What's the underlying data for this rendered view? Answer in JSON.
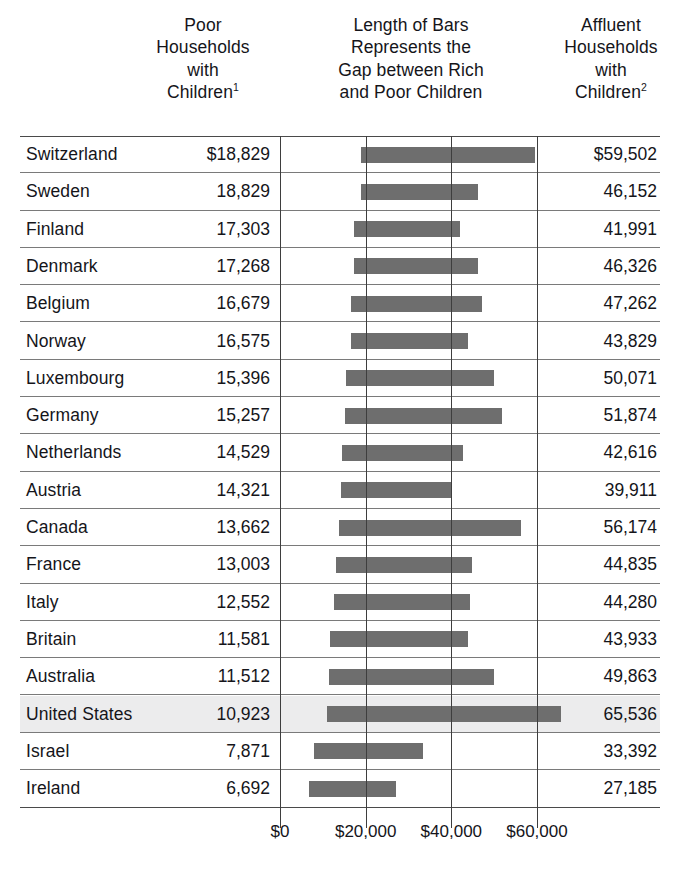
{
  "headers": {
    "poor": "Poor\nHouseholds\nwith\nChildren",
    "poor_lines": [
      "Poor",
      "Households",
      "with",
      "Children"
    ],
    "poor_superscript": "1",
    "middle_lines": [
      "Length of Bars",
      "Represents the",
      "Gap between Rich",
      "and Poor Children"
    ],
    "affluent_lines": [
      "Affluent",
      "Households",
      "with",
      "Children"
    ],
    "affluent_superscript": "2"
  },
  "colors": {
    "bar": "#6e6e6e",
    "highlight_row": "#ececed",
    "gridline": "#3e3e3e",
    "row_rule": "#7a7a7a",
    "frame_rule": "#4a4a4a",
    "text": "#15151a"
  },
  "axis": {
    "ticks": [
      "$0",
      "$20,000",
      "$40,000",
      "$60,000"
    ],
    "tick_values": [
      0,
      20000,
      40000,
      60000
    ],
    "x_zero_px": 280,
    "px_per_dollar": 0.004283
  },
  "chart_data": {
    "type": "bar",
    "title": "Length of Bars Represents the Gap between Rich and Poor Children",
    "xlabel": "",
    "ylabel": "",
    "xlim": [
      0,
      70000
    ],
    "grid": true,
    "legend": "none",
    "orientation": "horizontal",
    "bar_style": "floating-range",
    "note": "Each bar spans from the Poor Households value to the Affluent Households value.",
    "columns": [
      "Country",
      "Poor Households with Children",
      "Affluent Households with Children"
    ],
    "categories": [
      "Switzerland",
      "Sweden",
      "Finland",
      "Denmark",
      "Belgium",
      "Norway",
      "Luxembourg",
      "Germany",
      "Netherlands",
      "Austria",
      "Canada",
      "France",
      "Italy",
      "Britain",
      "Australia",
      "United States",
      "Israel",
      "Ireland"
    ],
    "series": [
      {
        "name": "Poor Households with Children",
        "values": [
          18829,
          18829,
          17303,
          17268,
          16679,
          16575,
          15396,
          15257,
          14529,
          14321,
          13662,
          13003,
          12552,
          11581,
          11512,
          10923,
          7871,
          6692
        ]
      },
      {
        "name": "Affluent Households with Children",
        "values": [
          59502,
          46152,
          41991,
          46326,
          47262,
          43829,
          50071,
          51874,
          42616,
          39911,
          56174,
          44835,
          44280,
          43933,
          49863,
          65536,
          33392,
          27185
        ]
      }
    ]
  },
  "rows": [
    {
      "country": "Switzerland",
      "poor": "$18,829",
      "affluent": "$59,502",
      "poor_value": 18829,
      "affluent_value": 59502,
      "highlight": false
    },
    {
      "country": "Sweden",
      "poor": "18,829",
      "affluent": "46,152",
      "poor_value": 18829,
      "affluent_value": 46152,
      "highlight": false
    },
    {
      "country": "Finland",
      "poor": "17,303",
      "affluent": "41,991",
      "poor_value": 17303,
      "affluent_value": 41991,
      "highlight": false
    },
    {
      "country": "Denmark",
      "poor": "17,268",
      "affluent": "46,326",
      "poor_value": 17268,
      "affluent_value": 46326,
      "highlight": false
    },
    {
      "country": "Belgium",
      "poor": "16,679",
      "affluent": "47,262",
      "poor_value": 16679,
      "affluent_value": 47262,
      "highlight": false
    },
    {
      "country": "Norway",
      "poor": "16,575",
      "affluent": "43,829",
      "poor_value": 16575,
      "affluent_value": 43829,
      "highlight": false
    },
    {
      "country": "Luxembourg",
      "poor": "15,396",
      "affluent": "50,071",
      "poor_value": 15396,
      "affluent_value": 50071,
      "highlight": false
    },
    {
      "country": "Germany",
      "poor": "15,257",
      "affluent": "51,874",
      "poor_value": 15257,
      "affluent_value": 51874,
      "highlight": false
    },
    {
      "country": "Netherlands",
      "poor": "14,529",
      "affluent": "42,616",
      "poor_value": 14529,
      "affluent_value": 42616,
      "highlight": false
    },
    {
      "country": "Austria",
      "poor": "14,321",
      "affluent": "39,911",
      "poor_value": 14321,
      "affluent_value": 39911,
      "highlight": false
    },
    {
      "country": "Canada",
      "poor": "13,662",
      "affluent": "56,174",
      "poor_value": 13662,
      "affluent_value": 56174,
      "highlight": false
    },
    {
      "country": "France",
      "poor": "13,003",
      "affluent": "44,835",
      "poor_value": 13003,
      "affluent_value": 44835,
      "highlight": false
    },
    {
      "country": "Italy",
      "poor": "12,552",
      "affluent": "44,280",
      "poor_value": 12552,
      "affluent_value": 44280,
      "highlight": false
    },
    {
      "country": "Britain",
      "poor": "11,581",
      "affluent": "43,933",
      "poor_value": 11581,
      "affluent_value": 43933,
      "highlight": false
    },
    {
      "country": "Australia",
      "poor": "11,512",
      "affluent": "49,863",
      "poor_value": 11512,
      "affluent_value": 49863,
      "highlight": false
    },
    {
      "country": "United States",
      "poor": "10,923",
      "affluent": "65,536",
      "poor_value": 10923,
      "affluent_value": 65536,
      "highlight": true
    },
    {
      "country": "Israel",
      "poor": "7,871",
      "affluent": "33,392",
      "poor_value": 7871,
      "affluent_value": 33392,
      "highlight": false
    },
    {
      "country": "Ireland",
      "poor": "6,692",
      "affluent": "27,185",
      "poor_value": 6692,
      "affluent_value": 27185,
      "highlight": false
    }
  ]
}
